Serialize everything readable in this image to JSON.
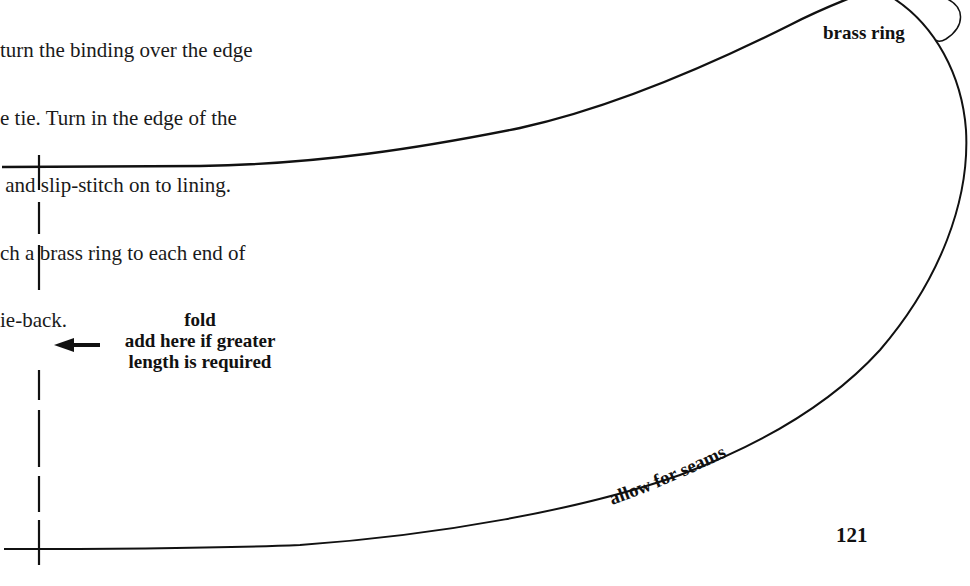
{
  "instructions": {
    "lines": [
      "turn the binding over the edge",
      "e tie. Turn in the edge of the",
      " and slip-stitch on to lining.",
      "ch a brass ring to each end of",
      "ie-back."
    ]
  },
  "pattern": {
    "brass_ring_label": "brass ring",
    "fold_label": "fold",
    "extend_note_line1": "add here if greater",
    "extend_note_line2": "length is required",
    "seam_label": "allow for seams",
    "arrow_icon": "left-arrow-icon",
    "line_color": "#111111"
  },
  "page": {
    "number": "121"
  }
}
